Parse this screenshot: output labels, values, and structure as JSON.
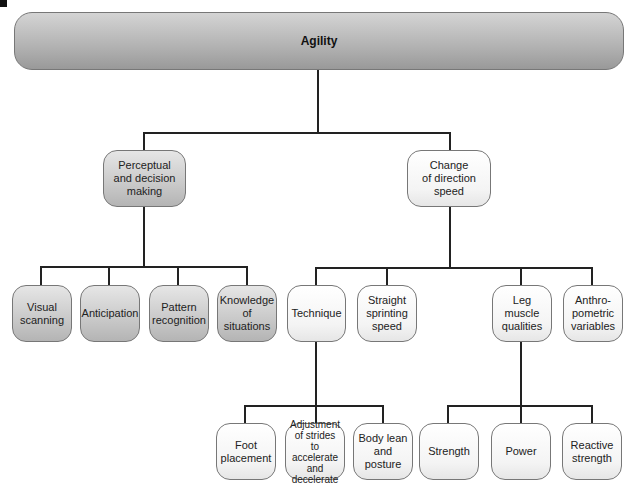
{
  "diagram": {
    "root": {
      "label": "Agility"
    },
    "level1": [
      {
        "label": "Perceptual\nand decision\nmaking"
      },
      {
        "label": "Change\nof direction\nspeed"
      }
    ],
    "perceptual_children": [
      {
        "label": "Visual\nscanning"
      },
      {
        "label": "Anticipation"
      },
      {
        "label": "Pattern\nrecognition"
      },
      {
        "label": "Knowledge\nof\nsituations"
      }
    ],
    "cod_children": [
      {
        "label": "Technique"
      },
      {
        "label": "Straight\nsprinting\nspeed"
      },
      {
        "label": "Leg\nmuscle\nqualities"
      },
      {
        "label": "Anthro-\npometric\nvariables"
      }
    ],
    "technique_children": [
      {
        "label": "Foot\nplacement"
      },
      {
        "label": "Adjustment\nof strides\nto accelerate\nand\ndecelerate"
      },
      {
        "label": "Body lean\nand posture"
      }
    ],
    "leg_muscle_children": [
      {
        "label": "Strength"
      },
      {
        "label": "Power"
      },
      {
        "label": "Reactive\nstrength"
      }
    ]
  }
}
